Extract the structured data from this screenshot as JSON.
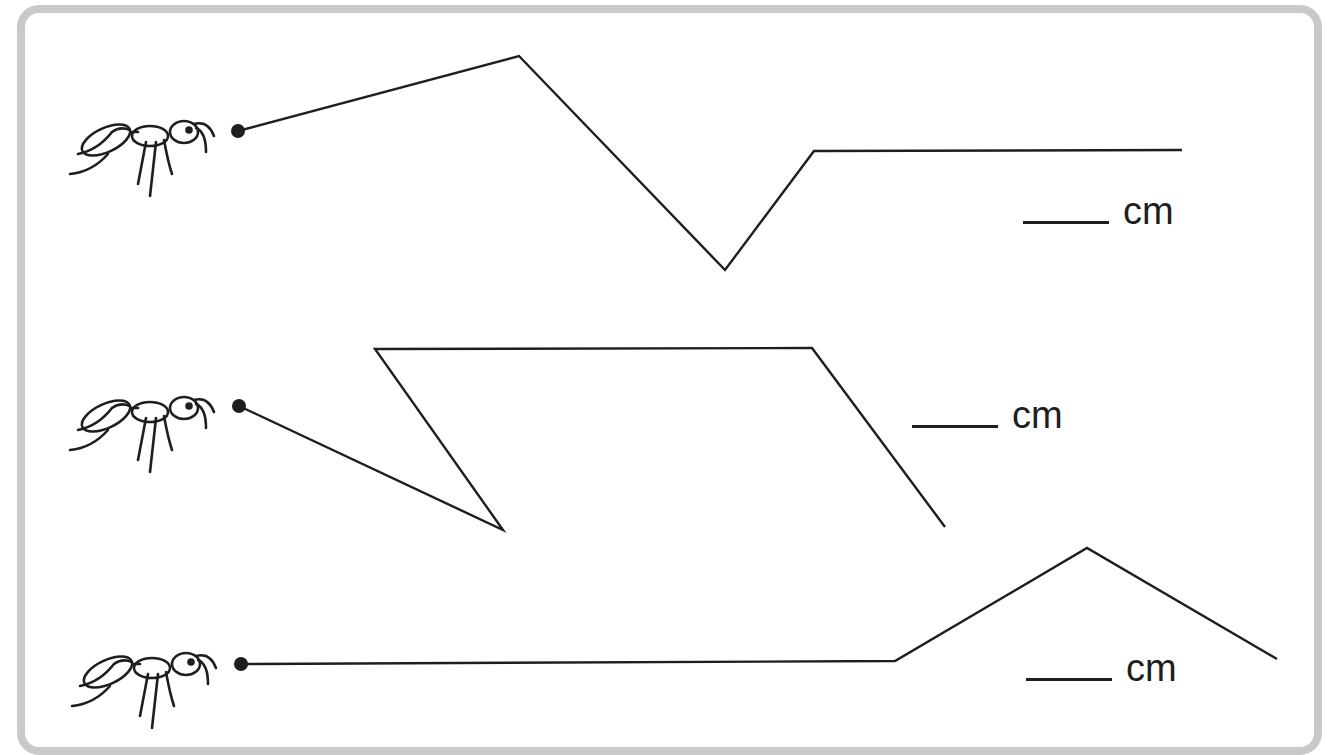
{
  "worksheet": {
    "title": "Measure the path each ant walks",
    "frame_color": "#c9c9c9",
    "ink_color": "#1e1e1e",
    "paths": [
      {
        "id": "path-1",
        "ant": "ant-icon",
        "start_dot": [
          238,
          131
        ],
        "points": [
          [
            238,
            131
          ],
          [
            519,
            56
          ],
          [
            725,
            270
          ],
          [
            814,
            151
          ],
          [
            1182,
            150
          ]
        ],
        "answer": {
          "blank": "",
          "unit": "cm"
        }
      },
      {
        "id": "path-2",
        "ant": "ant-icon",
        "start_dot": [
          238,
          406
        ],
        "points": [
          [
            238,
            406
          ],
          [
            503,
            530
          ],
          [
            375,
            349
          ],
          [
            812,
            348
          ],
          [
            945,
            527
          ]
        ],
        "answer": {
          "blank": "",
          "unit": "cm"
        }
      },
      {
        "id": "path-3",
        "ant": "ant-icon",
        "start_dot": [
          240,
          664
        ],
        "points": [
          [
            240,
            664
          ],
          [
            895,
            661
          ],
          [
            1087,
            548
          ],
          [
            1277,
            659
          ]
        ],
        "answer": {
          "blank": "",
          "unit": "cm"
        }
      }
    ]
  }
}
